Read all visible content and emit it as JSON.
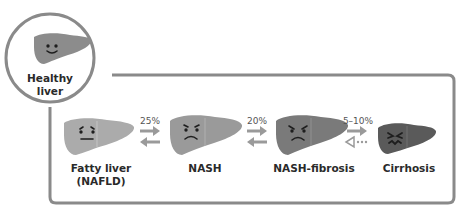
{
  "diagram": {
    "healthy": {
      "label_line1": "Healthy",
      "label_line2": "liver",
      "face": "smile"
    },
    "stages": [
      {
        "label_line1": "Fatty liver",
        "label_line2": "(NAFLD)",
        "face": "worried"
      },
      {
        "label_line1": "NASH",
        "label_line2": "",
        "face": "sad"
      },
      {
        "label_line1": "NASH-fibrosis",
        "label_line2": "",
        "face": "angry"
      },
      {
        "label_line1": "Cirrhosis",
        "label_line2": "",
        "face": "distressed"
      }
    ],
    "transitions": [
      {
        "from": "Fatty liver (NAFLD)",
        "to": "NASH",
        "percent": "25%",
        "reverse": "solid"
      },
      {
        "from": "NASH",
        "to": "NASH-fibrosis",
        "percent": "20%",
        "reverse": "solid"
      },
      {
        "from": "NASH-fibrosis",
        "to": "Cirrhosis",
        "percent": "5–10%",
        "reverse": "dotted"
      }
    ],
    "colors": {
      "frame": "#8a8a8a",
      "healthy_liver": "#8c8c8c",
      "fatty_liver": "#ababab",
      "nash_liver": "#9a9a9a",
      "fibrosis_liver": "#7a7a7a",
      "cirrhosis_liver": "#5a5a5a",
      "arrow": "#9a9a9a",
      "face": "#1e1e1e"
    }
  }
}
